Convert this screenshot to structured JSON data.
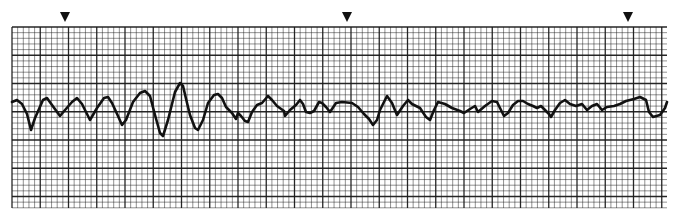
{
  "strip": {
    "title": "ECG rhythm strip",
    "label": "ECG rhythm strip",
    "paper_color": "#ffffff",
    "grid_color": "#1a1a1a",
    "trace_color": "#111111",
    "grid": {
      "x0": 12,
      "y0": 27,
      "x1": 667,
      "y1": 208,
      "small_px": 5.65,
      "major_every": 5
    },
    "markers": [
      {
        "x": 65,
        "y": 12,
        "icon": "triangle-down-icon"
      },
      {
        "x": 347,
        "y": 12,
        "icon": "triangle-down-icon"
      },
      {
        "x": 628,
        "y": 12,
        "icon": "triangle-down-icon"
      }
    ],
    "trace": [
      [
        12,
        102
      ],
      [
        17,
        100
      ],
      [
        22,
        104
      ],
      [
        27,
        114
      ],
      [
        31,
        130
      ],
      [
        35,
        118
      ],
      [
        43,
        100
      ],
      [
        47,
        98
      ],
      [
        52,
        105
      ],
      [
        60,
        116
      ],
      [
        65,
        110
      ],
      [
        72,
        102
      ],
      [
        77,
        98
      ],
      [
        82,
        104
      ],
      [
        90,
        120
      ],
      [
        97,
        108
      ],
      [
        104,
        98
      ],
      [
        108,
        97
      ],
      [
        112,
        103
      ],
      [
        118,
        116
      ],
      [
        122,
        125
      ],
      [
        126,
        120
      ],
      [
        133,
        102
      ],
      [
        140,
        93
      ],
      [
        145,
        91
      ],
      [
        150,
        96
      ],
      [
        155,
        115
      ],
      [
        160,
        133
      ],
      [
        163,
        136
      ],
      [
        168,
        120
      ],
      [
        175,
        92
      ],
      [
        180,
        83
      ],
      [
        183,
        86
      ],
      [
        188,
        107
      ],
      [
        190,
        115
      ],
      [
        195,
        128
      ],
      [
        198,
        130
      ],
      [
        203,
        120
      ],
      [
        208,
        103
      ],
      [
        214,
        95
      ],
      [
        218,
        94
      ],
      [
        222,
        98
      ],
      [
        226,
        107
      ],
      [
        232,
        113
      ],
      [
        236,
        119
      ],
      [
        238,
        113
      ],
      [
        241,
        116
      ],
      [
        245,
        121
      ],
      [
        248,
        122
      ],
      [
        252,
        112
      ],
      [
        257,
        105
      ],
      [
        262,
        103
      ],
      [
        268,
        96
      ],
      [
        272,
        100
      ],
      [
        277,
        106
      ],
      [
        284,
        111
      ],
      [
        285,
        116
      ],
      [
        290,
        110
      ],
      [
        296,
        105
      ],
      [
        300,
        100
      ],
      [
        303,
        104
      ],
      [
        306,
        112
      ],
      [
        310,
        113
      ],
      [
        314,
        111
      ],
      [
        319,
        102
      ],
      [
        322,
        103
      ],
      [
        326,
        107
      ],
      [
        330,
        112
      ],
      [
        336,
        103
      ],
      [
        342,
        102
      ],
      [
        352,
        103
      ],
      [
        358,
        107
      ],
      [
        364,
        114
      ],
      [
        369,
        119
      ],
      [
        373,
        125
      ],
      [
        377,
        120
      ],
      [
        380,
        110
      ],
      [
        387,
        96
      ],
      [
        392,
        103
      ],
      [
        397,
        115
      ],
      [
        403,
        106
      ],
      [
        408,
        100
      ],
      [
        412,
        104
      ],
      [
        420,
        108
      ],
      [
        426,
        117
      ],
      [
        430,
        120
      ],
      [
        434,
        110
      ],
      [
        438,
        102
      ],
      [
        445,
        104
      ],
      [
        452,
        108
      ],
      [
        460,
        111
      ],
      [
        464,
        113
      ],
      [
        470,
        109
      ],
      [
        475,
        106
      ],
      [
        478,
        112
      ],
      [
        485,
        106
      ],
      [
        492,
        101
      ],
      [
        497,
        102
      ],
      [
        500,
        108
      ],
      [
        504,
        116
      ],
      [
        508,
        113
      ],
      [
        513,
        105
      ],
      [
        518,
        101
      ],
      [
        523,
        101
      ],
      [
        528,
        104
      ],
      [
        533,
        106
      ],
      [
        537,
        108
      ],
      [
        541,
        106
      ],
      [
        545,
        110
      ],
      [
        549,
        114
      ],
      [
        551,
        117
      ],
      [
        555,
        110
      ],
      [
        560,
        103
      ],
      [
        565,
        100
      ],
      [
        570,
        104
      ],
      [
        576,
        106
      ],
      [
        582,
        104
      ],
      [
        587,
        110
      ],
      [
        592,
        106
      ],
      [
        597,
        104
      ],
      [
        602,
        110
      ],
      [
        607,
        107
      ],
      [
        614,
        106
      ],
      [
        620,
        104
      ],
      [
        626,
        101
      ],
      [
        634,
        99
      ],
      [
        640,
        97
      ],
      [
        646,
        100
      ],
      [
        649,
        112
      ],
      [
        653,
        117
      ],
      [
        660,
        115
      ],
      [
        665,
        108
      ],
      [
        667,
        102
      ]
    ]
  }
}
